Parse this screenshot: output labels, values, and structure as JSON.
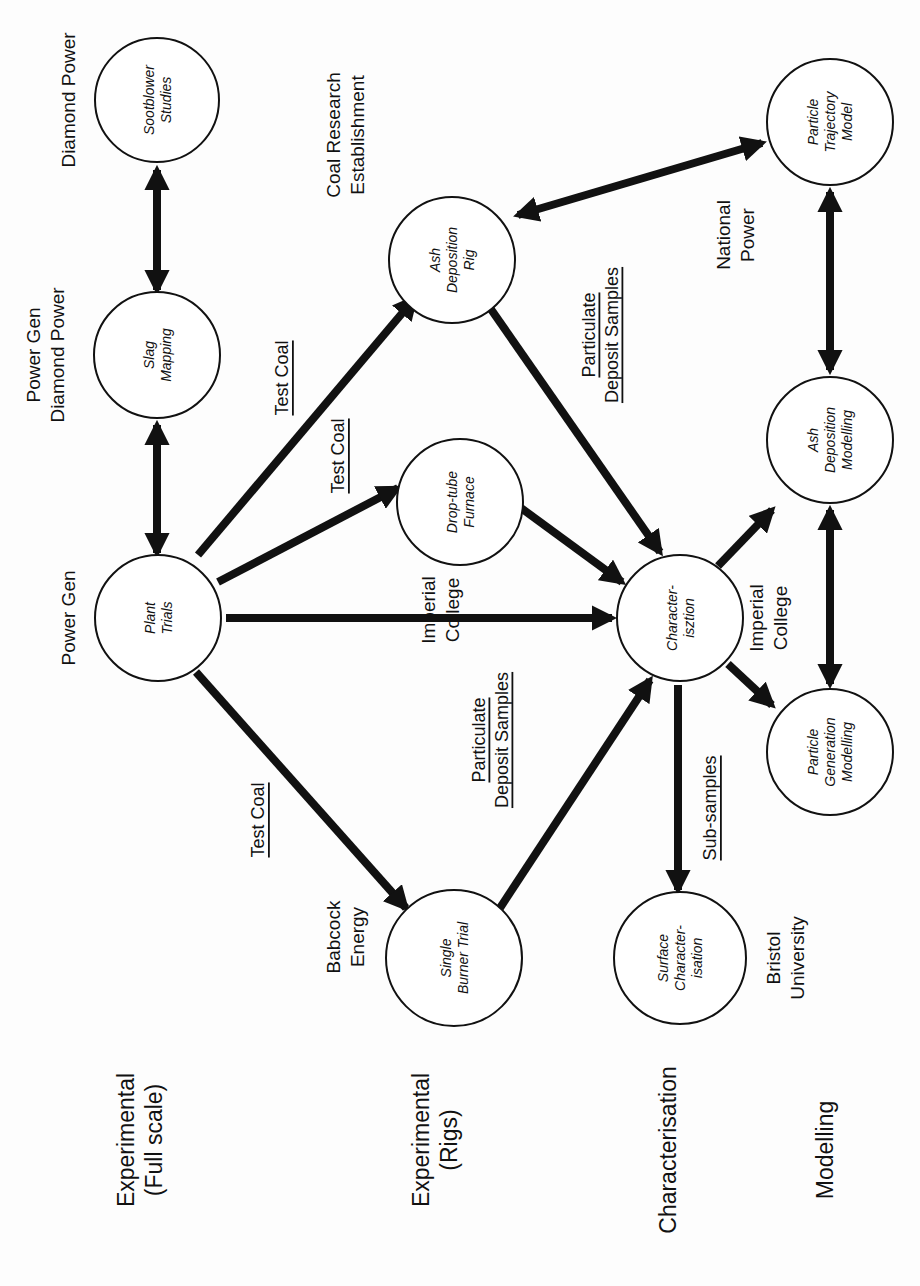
{
  "diagram": {
    "orientation": "rotated -90deg (text reads bottom-to-top)",
    "categories": [
      {
        "id": "cat-full-scale",
        "lines": [
          "Experimental",
          "(Full scale)"
        ],
        "x": 140,
        "y": 1140
      },
      {
        "id": "cat-rigs",
        "lines": [
          "Experimental",
          "(Rigs)"
        ],
        "x": 435,
        "y": 1140
      },
      {
        "id": "cat-characterisation",
        "lines": [
          "Characterisation"
        ],
        "x": 668,
        "y": 1150
      },
      {
        "id": "cat-modelling",
        "lines": [
          "Modelling"
        ],
        "x": 825,
        "y": 1150
      }
    ],
    "nodes": [
      {
        "id": "sootblower-studies",
        "lines": [
          "Sootblower",
          "Studies"
        ],
        "cx": 157,
        "cy": 100,
        "r": 62
      },
      {
        "id": "slag-mapping",
        "lines": [
          "Slag",
          "Mapping"
        ],
        "cx": 157,
        "cy": 355,
        "r": 63
      },
      {
        "id": "plant-trials",
        "lines": [
          "Plant",
          "Trials"
        ],
        "cx": 158,
        "cy": 618,
        "r": 63
      },
      {
        "id": "ash-deposition-rig",
        "lines": [
          "Ash",
          "Deposition",
          "Rig"
        ],
        "cx": 452,
        "cy": 260,
        "r": 63
      },
      {
        "id": "drop-tube-furnace",
        "lines": [
          "Drop-tube",
          "Furnace"
        ],
        "cx": 460,
        "cy": 502,
        "r": 63
      },
      {
        "id": "characterisation-node",
        "lines": [
          "Character-",
          "isztion"
        ],
        "cx": 680,
        "cy": 618,
        "r": 63
      },
      {
        "id": "single-burner-trial",
        "lines": [
          "Single",
          "Burner Trial"
        ],
        "cx": 454,
        "cy": 958,
        "r": 68
      },
      {
        "id": "surface-characterisation",
        "lines": [
          "Surface",
          "Character-",
          "isation"
        ],
        "cx": 680,
        "cy": 958,
        "r": 66
      },
      {
        "id": "particle-trajectory-model",
        "lines": [
          "Particle",
          "Trajectory",
          "Model"
        ],
        "cx": 830,
        "cy": 122,
        "r": 63
      },
      {
        "id": "ash-deposition-modelling",
        "lines": [
          "Ash",
          "Deposition",
          "Modelling"
        ],
        "cx": 830,
        "cy": 440,
        "r": 63
      },
      {
        "id": "particle-generation-modelling",
        "lines": [
          "Particle",
          "Generation",
          "Modelling"
        ],
        "cx": 830,
        "cy": 752,
        "r": 63
      }
    ],
    "organisations": [
      {
        "id": "org-diamond-power",
        "lines": [
          "Diamond Power"
        ],
        "x": 68,
        "y": 100
      },
      {
        "id": "org-power-gen-diamond-power",
        "lines": [
          "Power Gen",
          "Diamond Power"
        ],
        "x": 45,
        "y": 355
      },
      {
        "id": "org-power-gen",
        "lines": [
          "Power Gen"
        ],
        "x": 68,
        "y": 618
      },
      {
        "id": "org-coal-research",
        "lines": [
          "Coal Research",
          "Establishment"
        ],
        "x": 345,
        "y": 135
      },
      {
        "id": "org-imperial-college-1",
        "lines": [
          "Imperial",
          "College"
        ],
        "x": 440,
        "y": 610
      },
      {
        "id": "org-babcock-energy",
        "lines": [
          "Babcock",
          "Energy"
        ],
        "x": 345,
        "y": 937
      },
      {
        "id": "org-national-power",
        "lines": [
          "National",
          "Power"
        ],
        "x": 735,
        "y": 235
      },
      {
        "id": "org-imperial-college-2",
        "lines": [
          "Imperial",
          "College"
        ],
        "x": 768,
        "y": 618
      },
      {
        "id": "org-bristol-university",
        "lines": [
          "Bristol",
          "University"
        ],
        "x": 785,
        "y": 958
      }
    ],
    "flow_labels": [
      {
        "id": "flow-test-coal-1",
        "lines": [
          "Test Coal"
        ],
        "x": 282,
        "y": 378
      },
      {
        "id": "flow-test-coal-2",
        "lines": [
          "Test Coal"
        ],
        "x": 338,
        "y": 456
      },
      {
        "id": "flow-particulate-deposit-1",
        "lines": [
          "Particulate",
          "Deposit Samples"
        ],
        "x": 600,
        "y": 335
      },
      {
        "id": "flow-test-coal-3",
        "lines": [
          "Test Coal"
        ],
        "x": 258,
        "y": 820
      },
      {
        "id": "flow-particulate-deposit-2",
        "lines": [
          "Particulate",
          "Deposit Samples"
        ],
        "x": 490,
        "y": 740
      },
      {
        "id": "flow-sub-samples",
        "lines": [
          "Sub-samples"
        ],
        "x": 710,
        "y": 808
      }
    ],
    "edges": [
      {
        "id": "edge-slag-sootblower",
        "x1": 157,
        "y1": 170,
        "x2": 157,
        "y2": 290,
        "bidirectional": true
      },
      {
        "id": "edge-plant-slag",
        "x1": 157,
        "y1": 425,
        "x2": 157,
        "y2": 553,
        "bidirectional": true
      },
      {
        "id": "edge-plant-ashrig",
        "x1": 198,
        "y1": 555,
        "x2": 415,
        "y2": 298,
        "bidirectional": false
      },
      {
        "id": "edge-plant-droptube",
        "x1": 218,
        "y1": 582,
        "x2": 398,
        "y2": 488,
        "bidirectional": false
      },
      {
        "id": "edge-plant-charact",
        "x1": 226,
        "y1": 618,
        "x2": 612,
        "y2": 618,
        "bidirectional": false
      },
      {
        "id": "edge-plant-single-burner",
        "x1": 196,
        "y1": 672,
        "x2": 406,
        "y2": 908,
        "bidirectional": false
      },
      {
        "id": "edge-ashrig-charact",
        "x1": 488,
        "y1": 305,
        "x2": 660,
        "y2": 552,
        "bidirectional": false
      },
      {
        "id": "edge-droptube-charact",
        "x1": 506,
        "y1": 497,
        "x2": 622,
        "y2": 582,
        "bidirectional": false
      },
      {
        "id": "edge-single-burner-charact",
        "x1": 500,
        "y1": 908,
        "x2": 650,
        "y2": 680,
        "bidirectional": false
      },
      {
        "id": "edge-charact-surface",
        "x1": 678,
        "y1": 685,
        "x2": 678,
        "y2": 890,
        "bidirectional": false
      },
      {
        "id": "edge-charact-ashmod",
        "x1": 718,
        "y1": 566,
        "x2": 772,
        "y2": 510,
        "bidirectional": false
      },
      {
        "id": "edge-charact-partgen",
        "x1": 728,
        "y1": 664,
        "x2": 772,
        "y2": 705,
        "bidirectional": false
      },
      {
        "id": "edge-ashrig-trajectory",
        "x1": 518,
        "y1": 215,
        "x2": 762,
        "y2": 143,
        "bidirectional": true
      },
      {
        "id": "edge-ashmod-trajectory",
        "x1": 830,
        "y1": 192,
        "x2": 830,
        "y2": 370,
        "bidirectional": true
      },
      {
        "id": "edge-ashmod-partgen",
        "x1": 830,
        "y1": 510,
        "x2": 830,
        "y2": 684,
        "bidirectional": true
      }
    ],
    "colors": {
      "ink": "#111111",
      "background": "#fdfdfd"
    }
  }
}
